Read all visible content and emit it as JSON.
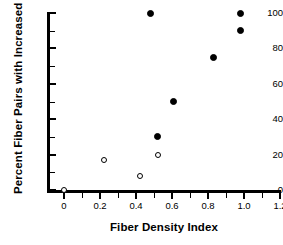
{
  "chart_data": {
    "type": "scatter",
    "title": "",
    "xlabel": "Fiber Density Index",
    "ylabel": "Percent Fiber Pairs with Increased Jitter",
    "xlim": [
      -0.06,
      1.26
    ],
    "ylim": [
      -5,
      103
    ],
    "grid": false,
    "legend": null,
    "xticks": [
      0,
      0.2,
      0.4,
      0.6,
      0.8,
      1.0,
      1.2
    ],
    "xtick_labels": [
      "0",
      "0.2",
      "0.4",
      "0.6",
      "0.8",
      "1.0",
      "1.2"
    ],
    "xminor_step": 0.1,
    "yticks": [
      0,
      20,
      40,
      60,
      80,
      100
    ],
    "ytick_labels": [
      "0",
      "20",
      "40",
      "60",
      "80",
      "100"
    ],
    "yminor_step": 10,
    "series": [
      {
        "name": "open-circles",
        "marker": "open-circle",
        "color": "#000000",
        "points": [
          {
            "x": 0.0,
            "y": 0
          },
          {
            "x": 0.22,
            "y": 17
          },
          {
            "x": 0.42,
            "y": 8
          },
          {
            "x": 0.52,
            "y": 20
          }
        ]
      },
      {
        "name": "filled-circles",
        "marker": "filled-circle",
        "color": "#000000",
        "points": [
          {
            "x": 0.48,
            "y": 100
          },
          {
            "x": 0.52,
            "y": 30
          },
          {
            "x": 0.61,
            "y": 50
          },
          {
            "x": 0.83,
            "y": 75
          },
          {
            "x": 0.98,
            "y": 90
          },
          {
            "x": 0.98,
            "y": 100
          }
        ]
      }
    ]
  },
  "figure": {
    "background": "#ffffff",
    "axis_color": "#000000"
  }
}
